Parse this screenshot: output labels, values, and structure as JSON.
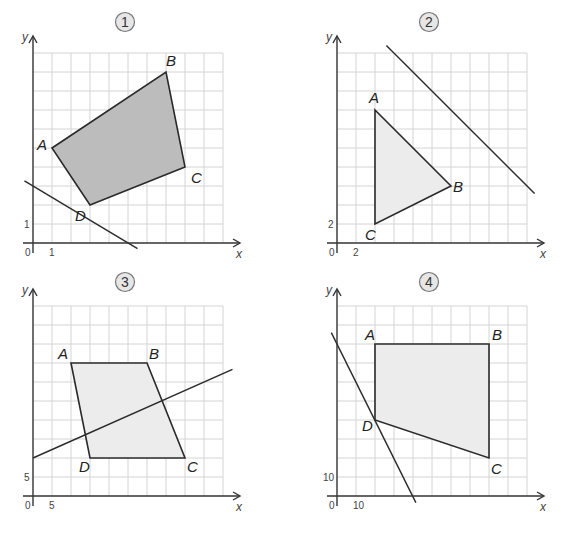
{
  "chart_data": [
    {
      "type": "diagram",
      "number": "1",
      "origin_label": "0",
      "x_tick_label": "1",
      "y_tick_label": "1",
      "x_axis": "x",
      "y_axis": "y",
      "unit": 1,
      "grid": [
        10,
        10
      ],
      "fill": "#bcbcbc",
      "polygon": [
        {
          "name": "A",
          "x": 1,
          "y": 5
        },
        {
          "name": "B",
          "x": 7,
          "y": 9
        },
        {
          "name": "C",
          "x": 8,
          "y": 4
        },
        {
          "name": "D",
          "x": 3,
          "y": 2
        }
      ],
      "line": {
        "x1": -0.45,
        "y1": 3.27,
        "x2": 5.5,
        "y2": -0.3
      }
    },
    {
      "type": "diagram",
      "number": "2",
      "origin_label": "0",
      "x_tick_label": "2",
      "y_tick_label": "2",
      "x_axis": "x",
      "y_axis": "y",
      "unit": 2,
      "grid": [
        10,
        10
      ],
      "fill": "#ececec",
      "polygon": [
        {
          "name": "A",
          "x": 2,
          "y": 7
        },
        {
          "name": "B",
          "x": 6,
          "y": 3
        },
        {
          "name": "C",
          "x": 2,
          "y": 1
        }
      ],
      "line": {
        "x1": 2.6,
        "y1": 10.4,
        "x2": 10.4,
        "y2": 2.6
      }
    },
    {
      "type": "diagram",
      "number": "3",
      "origin_label": "0",
      "x_tick_label": "5",
      "y_tick_label": "5",
      "x_axis": "x",
      "y_axis": "y",
      "unit": 5,
      "grid": [
        10,
        10
      ],
      "fill": "#ececec",
      "polygon": [
        {
          "name": "A",
          "x": 2,
          "y": 7
        },
        {
          "name": "B",
          "x": 6,
          "y": 7
        },
        {
          "name": "C",
          "x": 8,
          "y": 2
        },
        {
          "name": "D",
          "x": 3,
          "y": 2
        }
      ],
      "line": {
        "x1": 0,
        "y1": 2,
        "x2": 10.5,
        "y2": 6.67
      }
    },
    {
      "type": "diagram",
      "number": "4",
      "origin_label": "0",
      "x_tick_label": "10",
      "y_tick_label": "10",
      "x_axis": "x",
      "y_axis": "y",
      "unit": 10,
      "grid": [
        10,
        10
      ],
      "fill": "#ececec",
      "polygon": [
        {
          "name": "A",
          "x": 2,
          "y": 8
        },
        {
          "name": "B",
          "x": 8,
          "y": 8
        },
        {
          "name": "C",
          "x": 8,
          "y": 2
        },
        {
          "name": "D",
          "x": 2,
          "y": 4
        }
      ],
      "line": {
        "x1": -0.3,
        "y1": 8.6,
        "x2": 4.15,
        "y2": -0.35
      }
    }
  ]
}
